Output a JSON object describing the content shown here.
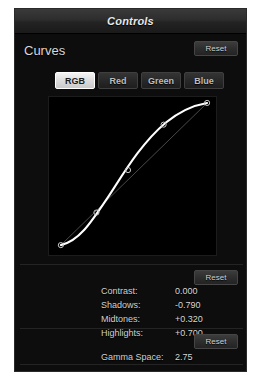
{
  "window": {
    "title": "Controls"
  },
  "curves_section": {
    "heading": "Curves",
    "reset_label": "Reset",
    "channel_tabs": [
      {
        "label": "RGB",
        "selected": true
      },
      {
        "label": "Red",
        "selected": false
      },
      {
        "label": "Green",
        "selected": false
      },
      {
        "label": "Blue",
        "selected": false
      }
    ],
    "graph": {
      "background_color": "#000000",
      "curve_color": "#ffffff",
      "reference_line_color": "#555555",
      "control_point_count": 5
    }
  },
  "values_section": {
    "reset_label": "Reset",
    "rows": [
      {
        "label": "Contrast:",
        "value": "0.000"
      },
      {
        "label": "Shadows:",
        "value": "-0.790"
      },
      {
        "label": "Midtones:",
        "value": "+0.320"
      },
      {
        "label": "Highlights:",
        "value": "+0.700"
      }
    ]
  },
  "gamma_section": {
    "reset_label": "Reset",
    "label": "Gamma Space:",
    "value": "2.75"
  }
}
